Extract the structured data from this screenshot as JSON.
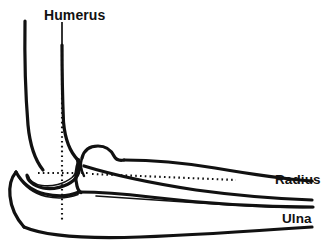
{
  "figure": {
    "kind": "anatomical-line-diagram",
    "background_color": "#ffffff",
    "line_color": "#111111"
  },
  "labels": {
    "humerus": "Humerus",
    "radius": "Radius",
    "ulna": "Ulna"
  },
  "annotations": {
    "humerus_leader": "solid leader line from Humerus label down to humeral shaft",
    "vertical_axis": "vertical dotted axis line through humeral shaft and joint center",
    "horizontal_axis_left": "horizontal dotted line through distal humerus joint center",
    "horizontal_axis_right": "horizontal dotted line running along the radius shaft"
  }
}
